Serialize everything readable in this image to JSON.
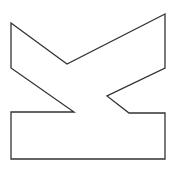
{
  "diagram": {
    "type": "outline-polygon",
    "canvas": {
      "width": 177,
      "height": 170,
      "background": "#ffffff"
    },
    "shape": {
      "name": "rotated-k-glyph-outline",
      "stroke": "#333333",
      "stroke_width": 1.3,
      "fill": "#ffffff",
      "points": "11,23 67,64 165,14 165,68 107,96 129,113 165,113 165,159 11,159 11,112 74,112 11,68"
    }
  }
}
